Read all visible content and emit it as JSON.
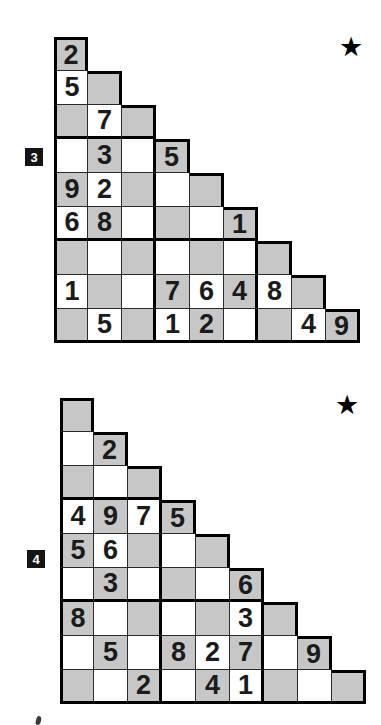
{
  "page": {
    "background": "#ffffff"
  },
  "colors": {
    "shaded_cell": "#c7c7c7",
    "white_cell": "#ffffff",
    "thin_line": "#2a2a2a",
    "thick_line": "#000000",
    "digit": "#1b1b1b",
    "badge_bg": "#141414",
    "badge_text": "#ffffff",
    "star": "#000000"
  },
  "puzzles": [
    {
      "label": "3",
      "star_char": "★",
      "block_size": 3,
      "rows": [
        [
          "2"
        ],
        [
          "5",
          ""
        ],
        [
          "",
          "7",
          ""
        ],
        [
          "",
          "3",
          "",
          "5"
        ],
        [
          "9",
          "2",
          "",
          "",
          ""
        ],
        [
          "6",
          "8",
          "",
          "",
          "",
          "1"
        ],
        [
          "",
          "",
          "",
          "",
          "",
          "",
          ""
        ],
        [
          "1",
          "",
          "",
          "7",
          "6",
          "4",
          "8",
          ""
        ],
        [
          "",
          "5",
          "",
          "1",
          "2",
          "",
          "",
          "4",
          "9"
        ]
      ],
      "shading": [
        [
          1
        ],
        [
          0,
          1
        ],
        [
          1,
          0,
          1
        ],
        [
          0,
          1,
          0,
          1
        ],
        [
          1,
          0,
          1,
          0,
          1
        ],
        [
          0,
          1,
          0,
          1,
          0,
          1
        ],
        [
          1,
          0,
          1,
          0,
          1,
          0,
          1
        ],
        [
          0,
          1,
          0,
          1,
          0,
          1,
          0,
          1
        ],
        [
          1,
          0,
          1,
          0,
          1,
          0,
          1,
          0,
          1
        ]
      ]
    },
    {
      "label": "4",
      "star_char": "★",
      "block_size": 3,
      "rows": [
        [
          ""
        ],
        [
          "",
          "2"
        ],
        [
          "",
          "",
          ""
        ],
        [
          "4",
          "9",
          "7",
          "5"
        ],
        [
          "5",
          "6",
          "",
          "",
          ""
        ],
        [
          "",
          "3",
          "",
          "",
          "",
          "6"
        ],
        [
          "8",
          "",
          "",
          "",
          "",
          "3",
          ""
        ],
        [
          "",
          "5",
          "",
          "8",
          "2",
          "7",
          "",
          "9"
        ],
        [
          "",
          "",
          "2",
          "",
          "4",
          "1",
          "",
          "",
          ""
        ]
      ],
      "shading": [
        [
          1
        ],
        [
          0,
          1
        ],
        [
          1,
          0,
          1
        ],
        [
          0,
          1,
          0,
          1
        ],
        [
          1,
          0,
          1,
          0,
          1
        ],
        [
          0,
          1,
          0,
          1,
          0,
          1
        ],
        [
          1,
          0,
          1,
          0,
          1,
          0,
          1
        ],
        [
          0,
          1,
          0,
          1,
          0,
          1,
          0,
          1
        ],
        [
          1,
          0,
          1,
          0,
          1,
          0,
          1,
          0,
          1
        ]
      ]
    }
  ]
}
